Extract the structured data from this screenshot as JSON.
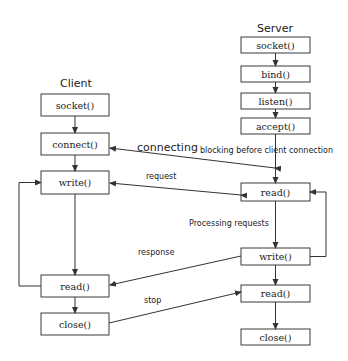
{
  "client": {
    "title": "Client",
    "steps": [
      "socket()",
      "connect()",
      "write()",
      "read()",
      "close()"
    ]
  },
  "server": {
    "title": "Server",
    "steps": [
      "socket()",
      "bind()",
      "listen()",
      "accept()",
      "read()",
      "write()",
      "read()",
      "close()"
    ]
  },
  "labels": {
    "connecting": "connecting",
    "blocking": "blocking before client connection",
    "request": "request",
    "processing": "Processing requests",
    "response": "response",
    "stop": "stop"
  },
  "colors": {
    "stroke": "#333333",
    "background": "#ffffff",
    "text": "#222222"
  }
}
